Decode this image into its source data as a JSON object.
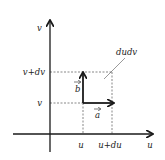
{
  "diagram": {
    "type": "coordinate-area-element",
    "colors": {
      "line": "#1a1a1a",
      "dashed": "#555555",
      "text": "#222222",
      "background": "#ffffff"
    },
    "axes": {
      "horizontal_label": "u",
      "vertical_label": "v"
    },
    "ticks": {
      "u": "u",
      "u_plus_du": "u+du",
      "v": "v",
      "v_plus_dv": "v+dv"
    },
    "vectors": {
      "a": {
        "label": "a",
        "direction": "along u"
      },
      "b": {
        "label": "b",
        "direction": "along v"
      }
    },
    "area_label": "dudv"
  }
}
